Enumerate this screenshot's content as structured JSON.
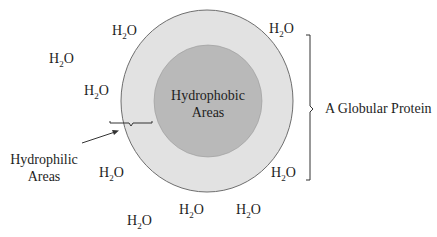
{
  "diagram": {
    "title": "A Globular Protein",
    "core_label": [
      "Hydrophobic",
      "Areas"
    ],
    "surface_label": [
      "Hydrophilic",
      "Areas"
    ],
    "protein_label": "A Globular Protein",
    "water_molecule": {
      "base": "H",
      "subscript": "2",
      "tail": "O"
    },
    "water_positions": [
      {
        "x": 112,
        "y": 35
      },
      {
        "x": 49,
        "y": 63
      },
      {
        "x": 84,
        "y": 95
      },
      {
        "x": 269,
        "y": 33
      },
      {
        "x": 99,
        "y": 177
      },
      {
        "x": 271,
        "y": 177
      },
      {
        "x": 179,
        "y": 214
      },
      {
        "x": 236,
        "y": 214
      },
      {
        "x": 127,
        "y": 225
      }
    ],
    "colors": {
      "outer_fill": "#e2e2e2",
      "inner_fill": "#b9b9b9",
      "stroke": "#6e6e6e",
      "text": "#1e1e1e"
    }
  }
}
